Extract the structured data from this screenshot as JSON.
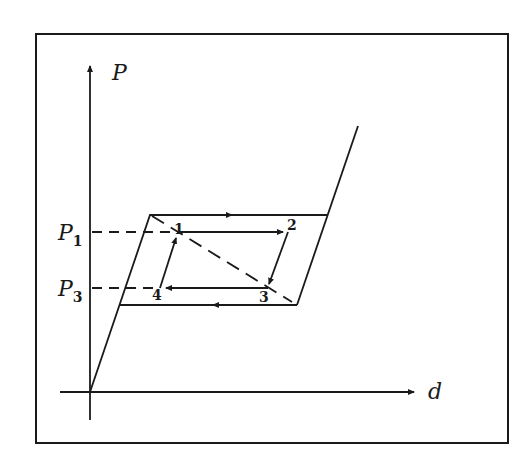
{
  "diagram": {
    "type": "hysteresis-loop",
    "axes": {
      "y_label": "P",
      "x_label": "d"
    },
    "levels": [
      {
        "label": "P",
        "subscript": "1"
      },
      {
        "label": "P",
        "subscript": "3"
      }
    ],
    "points": [
      {
        "id": "1",
        "label": "1"
      },
      {
        "id": "2",
        "label": "2"
      },
      {
        "id": "3",
        "label": "3"
      },
      {
        "id": "4",
        "label": "4"
      }
    ],
    "colors": {
      "ink": "#1a1a1a",
      "background": "#ffffff"
    }
  }
}
